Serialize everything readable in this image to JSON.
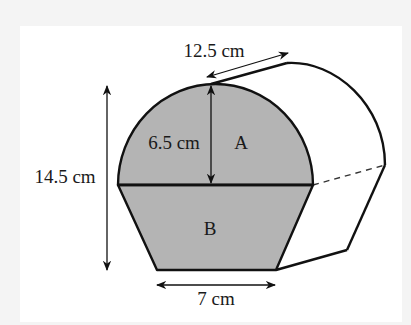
{
  "diagram": {
    "title": "",
    "shape": "prism with cross-section made of semicircle A on top of trapezium B",
    "regions": {
      "semicircle": {
        "label": "A"
      },
      "trapezium": {
        "label": "B"
      }
    },
    "dimensions": {
      "prism_length": "12.5 cm",
      "semicircle_radius": "6.5 cm",
      "total_height": "14.5 cm",
      "trapezium_base": "7 cm"
    },
    "colors": {
      "face_fill": "#b4b4b4",
      "outline": "#111111",
      "panel_background": "#ffffff",
      "page_background": "#f4f4f4"
    }
  }
}
